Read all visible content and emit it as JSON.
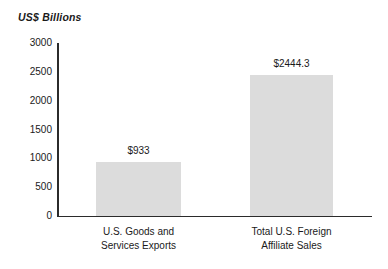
{
  "chart_data": {
    "type": "bar",
    "title": "",
    "subtitle": "",
    "ylabel": "US$ Billions",
    "xlabel": "",
    "categories": [
      "U.S. Goods and Services Exports",
      "Total U.S. Foreign Affiliate Sales"
    ],
    "category_lines": [
      [
        "U.S. Goods and",
        "Services Exports"
      ],
      [
        "Total U.S. Foreign",
        "Affiliate Sales"
      ]
    ],
    "values": [
      933,
      2444.3
    ],
    "value_labels": [
      "$933",
      "$2444.3"
    ],
    "ylim": [
      0,
      3000
    ],
    "yticks": [
      0,
      500,
      1000,
      1500,
      2000,
      2500,
      3000
    ],
    "ytick_labels": [
      "0",
      "500",
      "1000",
      "1500",
      "2000",
      "2500",
      "3000"
    ],
    "grid": false,
    "legend": null,
    "legend_position": "none",
    "bar_color": "#dcdcdc",
    "axis_color": "#2b2b2b",
    "text_color": "#1a1a1a",
    "background": "#ffffff"
  }
}
